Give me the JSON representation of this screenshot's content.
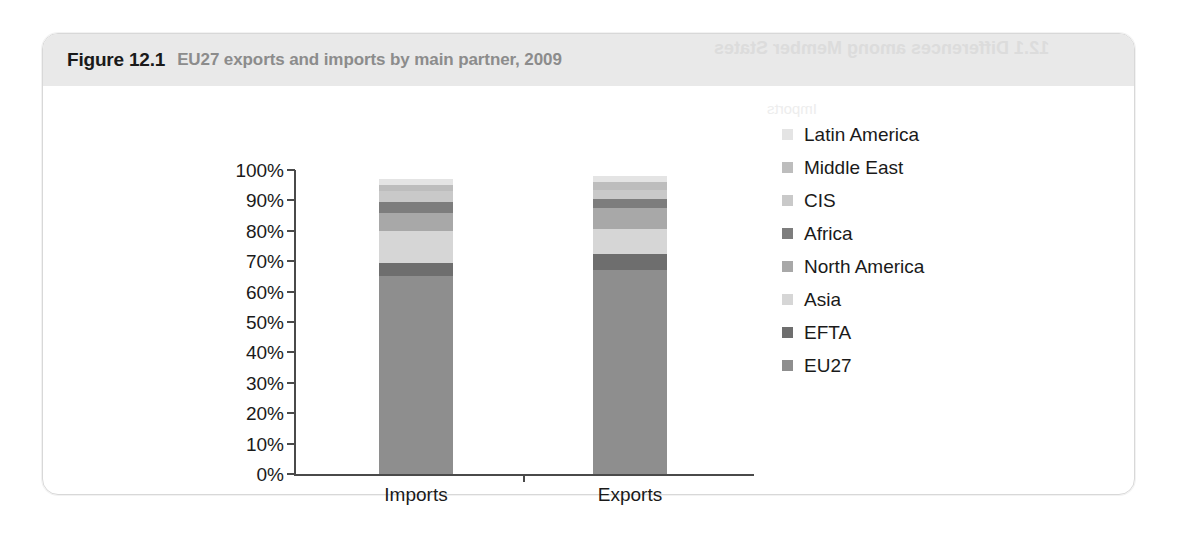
{
  "figure": {
    "number": "Figure 12.1",
    "title": "EU27 exports and imports by main partner, 2009",
    "ghost_text": "12.1 Differences among Member States",
    "ghost_text_2": "Imports"
  },
  "chart_data": {
    "type": "bar",
    "stacked": true,
    "stack_mode": "percent",
    "title": "EU27 exports and imports by main partner, 2009",
    "xlabel": "",
    "ylabel": "",
    "categories": [
      "Imports",
      "Exports"
    ],
    "ytick_labels": [
      "100%",
      "90%",
      "80%",
      "70%",
      "60%",
      "50%",
      "40%",
      "30%",
      "20%",
      "10%",
      "0%"
    ],
    "ytick_values": [
      100,
      90,
      80,
      70,
      60,
      50,
      40,
      30,
      20,
      10,
      0
    ],
    "ylim": [
      0,
      100
    ],
    "grid": false,
    "legend_position": "right",
    "series": [
      {
        "name": "EU27",
        "color": "#8e8e8e",
        "values": [
          65.0,
          67.0
        ]
      },
      {
        "name": "EFTA",
        "color": "#6e6e6e",
        "values": [
          4.5,
          5.5
        ]
      },
      {
        "name": "Asia",
        "color": "#d6d6d6",
        "values": [
          10.5,
          8.0
        ]
      },
      {
        "name": "North America",
        "color": "#a8a8a8",
        "values": [
          6.0,
          7.0
        ]
      },
      {
        "name": "Africa",
        "color": "#7d7d7d",
        "values": [
          3.5,
          3.0
        ]
      },
      {
        "name": "CIS",
        "color": "#c9c9c9",
        "values": [
          3.5,
          3.0
        ]
      },
      {
        "name": "Middle East",
        "color": "#bdbdbd",
        "values": [
          2.0,
          2.5
        ]
      },
      {
        "name": "Latin America",
        "color": "#e4e4e4",
        "values": [
          2.0,
          2.0
        ]
      }
    ],
    "legend_order_top_to_bottom": [
      "Latin America",
      "Middle East",
      "CIS",
      "Africa",
      "North America",
      "Asia",
      "EFTA",
      "EU27"
    ]
  },
  "colors": {
    "title_band": "#e9e9e9",
    "title_number": "#1a1a1a",
    "title_text": "#8c8c8c",
    "axis": "#4a4a4a",
    "page": "#ffffff"
  }
}
